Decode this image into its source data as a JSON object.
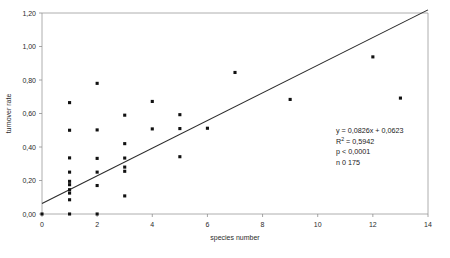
{
  "chart_data": {
    "type": "scatter",
    "title": "",
    "xlabel": "species number",
    "ylabel": "turnover rate",
    "xlim": [
      0,
      14
    ],
    "ylim": [
      0,
      1.2
    ],
    "xticks": [
      "0",
      "2",
      "4",
      "6",
      "8",
      "10",
      "12",
      "14"
    ],
    "xtick_values": [
      0,
      2,
      4,
      6,
      8,
      10,
      12,
      14
    ],
    "yticks": [
      "0,00",
      "0,20",
      "0,40",
      "0,60",
      "0,80",
      "1,00",
      "1,20"
    ],
    "ytick_values": [
      0,
      0.2,
      0.4,
      0.6,
      0.8,
      1.0,
      1.2
    ],
    "grid": false,
    "legend": "none",
    "decimal_separator": ",",
    "marker": "filled-square",
    "marker_color": "#111111",
    "points": [
      {
        "x": 0,
        "y": 0.0
      },
      {
        "x": 1,
        "y": 0.0
      },
      {
        "x": 1,
        "y": 0.085
      },
      {
        "x": 1,
        "y": 0.125
      },
      {
        "x": 1,
        "y": 0.145
      },
      {
        "x": 1,
        "y": 0.175
      },
      {
        "x": 1,
        "y": 0.195
      },
      {
        "x": 1,
        "y": 0.25
      },
      {
        "x": 1,
        "y": 0.335
      },
      {
        "x": 1,
        "y": 0.5
      },
      {
        "x": 1,
        "y": 0.665
      },
      {
        "x": 2,
        "y": 0.0
      },
      {
        "x": 2,
        "y": 0.17
      },
      {
        "x": 2,
        "y": 0.25
      },
      {
        "x": 2,
        "y": 0.332
      },
      {
        "x": 2,
        "y": 0.502
      },
      {
        "x": 2,
        "y": 0.78
      },
      {
        "x": 3,
        "y": 0.108
      },
      {
        "x": 3,
        "y": 0.255
      },
      {
        "x": 3,
        "y": 0.28
      },
      {
        "x": 3,
        "y": 0.334
      },
      {
        "x": 3,
        "y": 0.42
      },
      {
        "x": 3,
        "y": 0.59
      },
      {
        "x": 4,
        "y": 0.508
      },
      {
        "x": 4,
        "y": 0.672
      },
      {
        "x": 5,
        "y": 0.342
      },
      {
        "x": 5,
        "y": 0.51
      },
      {
        "x": 5,
        "y": 0.593
      },
      {
        "x": 6,
        "y": 0.512
      },
      {
        "x": 7,
        "y": 0.845
      },
      {
        "x": 9,
        "y": 0.684
      },
      {
        "x": 12,
        "y": 0.938
      },
      {
        "x": 13,
        "y": 0.692
      }
    ],
    "trendline": {
      "slope": 0.0826,
      "intercept": 0.0623,
      "x_start": 0,
      "x_end": 14,
      "color": "#2a2a2a"
    },
    "annotation": {
      "equation_prefix": "y = 0,0826x + 0,0623",
      "r_squared_label": "R",
      "r_squared_sup": "2",
      "r_squared_value": " = 0,5942",
      "p_value": "p < 0,0001",
      "n_value": "n 0 175"
    }
  }
}
